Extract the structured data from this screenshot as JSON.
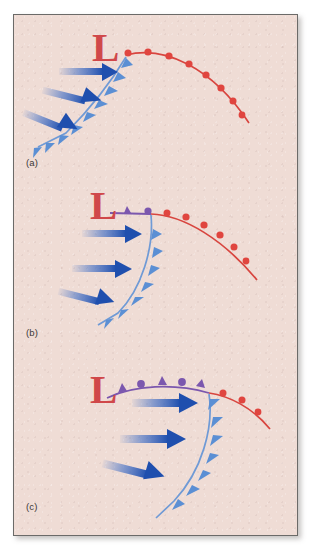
{
  "figure": {
    "background_color": "#efdcd5",
    "border_color": "#6b6a68"
  },
  "colors": {
    "cold_front": "#5b8fd4",
    "cold_front_line": "#6f9ad6",
    "warm_front": "#e0453f",
    "warm_front_line": "#d8453f",
    "occluded_front": "#7b57ae",
    "low_marker": "#d0484a",
    "arrow": "#2f63c4",
    "label_text": "#3b3835"
  },
  "legend_semantics": {
    "blue_triangle": "cold-front-barb",
    "red_semicircle": "warm-front-bump",
    "purple_triangle": "occluded-front-barb",
    "purple_semicircle": "occluded-front-bump",
    "blue_arrow": "cold-air-flow-arrow",
    "L": "low-pressure-center"
  },
  "panels": [
    {
      "id": "a",
      "label": "(a)",
      "low_label": "L",
      "description": "Open wave stage: cold front and warm front meet at the low center; no occlusion yet.",
      "fronts": [
        {
          "type": "cold",
          "symbol": "triangle",
          "color": "#5b8fd4",
          "symbol_count": 9
        },
        {
          "type": "warm",
          "symbol": "semicircle",
          "color": "#e0453f",
          "symbol_count": 9
        }
      ],
      "arrows": 3
    },
    {
      "id": "b",
      "label": "(b)",
      "low_label": "L",
      "description": "Occlusion begins: a short purple occluded segment forms at the low center.",
      "fronts": [
        {
          "type": "occluded",
          "symbol": "alternating",
          "color": "#7b57ae",
          "symbol_count": 2
        },
        {
          "type": "cold",
          "symbol": "triangle",
          "color": "#5b8fd4",
          "symbol_count": 8
        },
        {
          "type": "warm",
          "symbol": "semicircle",
          "color": "#e0453f",
          "symbol_count": 8
        }
      ],
      "arrows": 3
    },
    {
      "id": "c",
      "label": "(c)",
      "low_label": "L",
      "description": "Mature occlusion: long purple occluded front with alternating barbs and bumps; warm front shortened.",
      "fronts": [
        {
          "type": "occluded",
          "symbol": "alternating",
          "color": "#7b57ae",
          "symbol_count": 5
        },
        {
          "type": "cold",
          "symbol": "triangle",
          "color": "#5b8fd4",
          "symbol_count": 8
        },
        {
          "type": "warm",
          "symbol": "semicircle",
          "color": "#e0453f",
          "symbol_count": 3
        }
      ],
      "arrows": 3
    }
  ]
}
